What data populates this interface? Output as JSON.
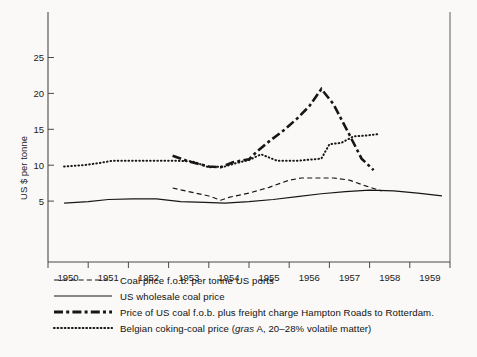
{
  "chart_data": {
    "type": "line",
    "title": "",
    "xlabel": "",
    "ylabel": "US $ per tonne",
    "xlim": [
      1949.5,
      1959.5
    ],
    "ylim": [
      0,
      27.5
    ],
    "yticks": [
      5,
      10,
      15,
      20,
      25
    ],
    "xticks": [
      "1950",
      "1951",
      "1952",
      "1953",
      "1954",
      "1955",
      "1956",
      "1957",
      "1958",
      "1959"
    ],
    "grid": false,
    "legend_position": "below-axes",
    "series": [
      {
        "name": "Coal price f.o.b. per tonne US ports",
        "style": "dashed",
        "x": [
          1952.6,
          1953.0,
          1953.5,
          1953.8,
          1954.0,
          1954.5,
          1955.0,
          1955.5,
          1955.8,
          1956.2,
          1956.6,
          1957.0,
          1957.4,
          1957.8
        ],
        "values": [
          10.3,
          9.8,
          9.2,
          8.6,
          9.0,
          9.6,
          10.4,
          11.4,
          11.7,
          11.7,
          11.7,
          11.4,
          10.6,
          9.9
        ]
      },
      {
        "name": "US wholesale coal price",
        "style": "solid",
        "x": [
          1949.9,
          1950.5,
          1951.0,
          1951.6,
          1952.2,
          1952.8,
          1953.4,
          1953.9,
          1954.5,
          1955.1,
          1955.7,
          1956.3,
          1956.9,
          1957.5,
          1958.1,
          1958.7,
          1959.3
        ],
        "values": [
          8.2,
          8.4,
          8.7,
          8.8,
          8.8,
          8.4,
          8.3,
          8.2,
          8.4,
          8.7,
          9.1,
          9.5,
          9.8,
          10.0,
          9.9,
          9.6,
          9.2
        ]
      },
      {
        "name": "Price of US coal f.o.b. plus freight charge Hampton Roads to Rotterdam.",
        "style": "dash-dot",
        "x": [
          1952.6,
          1953.0,
          1953.5,
          1953.8,
          1954.1,
          1954.5,
          1954.7,
          1955.0,
          1955.4,
          1955.7,
          1956.0,
          1956.3,
          1956.6,
          1957.0,
          1957.3,
          1957.6
        ],
        "values": [
          14.8,
          14.0,
          13.3,
          13.2,
          13.9,
          14.3,
          15.4,
          16.8,
          18.5,
          20.0,
          21.7,
          24.1,
          22.0,
          17.7,
          14.4,
          12.8
        ]
      },
      {
        "name": "Belgian coking-coal price (gras A, 20–28% volatile matter)",
        "style": "dotted",
        "x": [
          1949.9,
          1950.4,
          1950.8,
          1951.1,
          1951.6,
          1952.2,
          1952.7,
          1953.1,
          1953.5,
          1953.9,
          1954.2,
          1954.5,
          1954.8,
          1955.2,
          1955.7,
          1956.1,
          1956.3,
          1956.5,
          1956.8,
          1957.1,
          1957.4,
          1957.7
        ],
        "values": [
          13.3,
          13.5,
          13.8,
          14.1,
          14.1,
          14.1,
          14.1,
          14.0,
          13.2,
          13.3,
          13.8,
          14.2,
          15.0,
          14.1,
          14.1,
          14.3,
          14.4,
          16.4,
          16.6,
          17.5,
          17.6,
          17.8
        ]
      }
    ]
  },
  "legend": {
    "items": [
      {
        "style": "dashed",
        "label": "Coal price f.o.b. per tonne US ports"
      },
      {
        "style": "solid",
        "label": "US wholesale coal price"
      },
      {
        "style": "dash-dot",
        "label": "Price of US coal f.o.b. plus freight charge Hampton Roads to Rotterdam."
      },
      {
        "style": "dotted",
        "label_pre": "Belgian coking-coal price (",
        "label_em": "gras",
        "label_post": " A, 20–28% volatile matter)"
      }
    ]
  },
  "colors": {
    "ink": "#161616",
    "axis": "#4a4a4a",
    "background": "#faf9f7"
  }
}
